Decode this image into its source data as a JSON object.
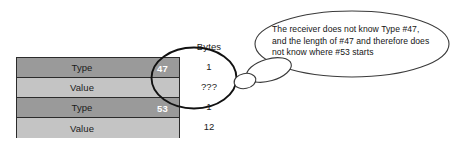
{
  "diagram": {
    "table": {
      "rows": [
        {
          "label": "Type",
          "type_number": "47",
          "shade": "dark",
          "bytes": "1"
        },
        {
          "label": "Value",
          "type_number": "",
          "shade": "light",
          "bytes": "???"
        },
        {
          "label": "Type",
          "type_number": "53",
          "shade": "dark",
          "bytes": "1"
        },
        {
          "label": "Value",
          "type_number": "",
          "shade": "light",
          "bytes": "12"
        }
      ],
      "row_fill_dark": "#9a9a9a",
      "row_fill_light": "#c4c4c4",
      "border_color": "#2b2b2b",
      "type_number_color": "#ffffff"
    },
    "bytes_column": {
      "header": "Bytes"
    },
    "highlight": {
      "name": "unknown-region-ellipse",
      "stroke": "#111111"
    },
    "thought_bubble": {
      "lines": [
        "The receiver does not know Type #47,",
        "and the length of #47 and therefore does",
        "not know where #53 starts"
      ],
      "stroke": "#3a3a3a",
      "fill": "#ffffff"
    }
  }
}
